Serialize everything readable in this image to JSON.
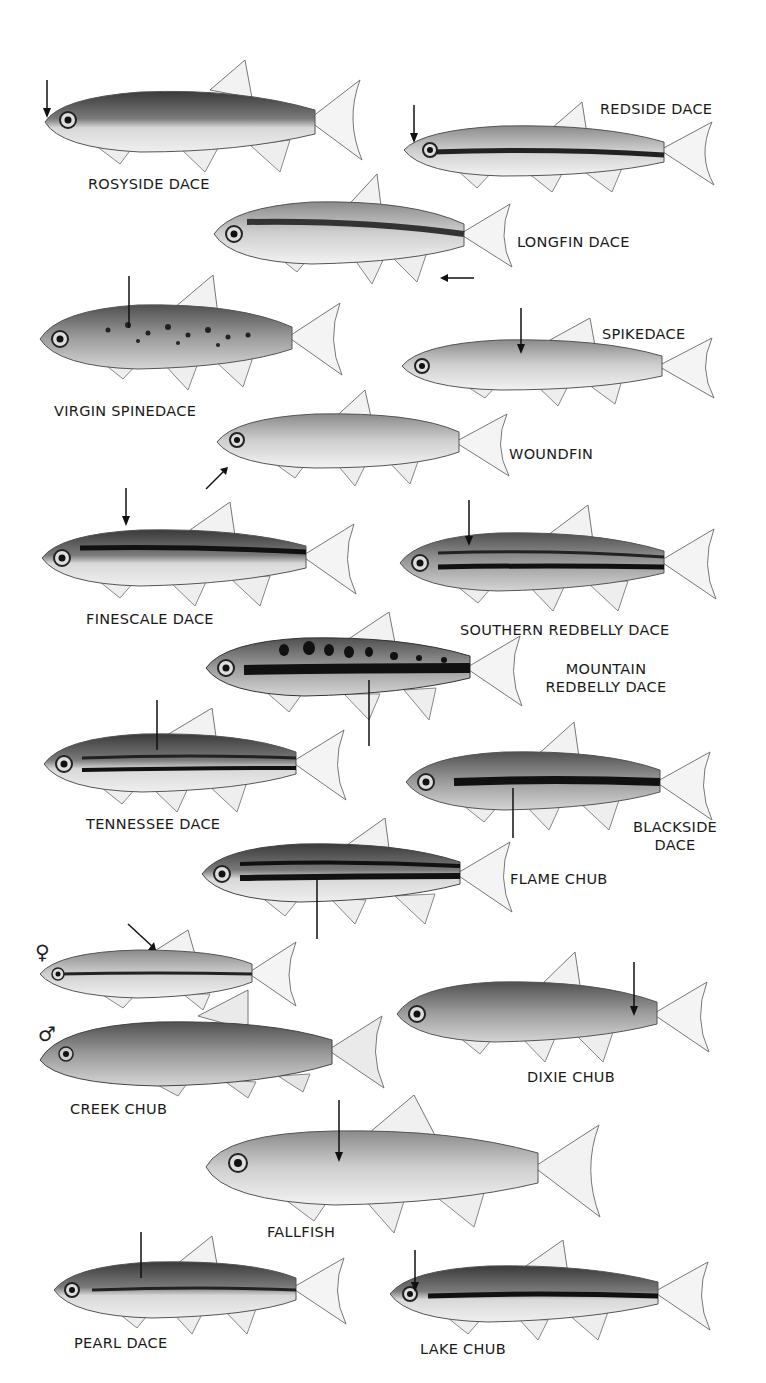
{
  "plate": {
    "species": [
      {
        "id": "rosyside",
        "label": "ROSYSIDE DACE"
      },
      {
        "id": "redside",
        "label": "REDSIDE DACE"
      },
      {
        "id": "longfin",
        "label": "LONGFIN DACE"
      },
      {
        "id": "virgin",
        "label": "VIRGIN SPINEDACE"
      },
      {
        "id": "spikedace",
        "label": "SPIKEDACE"
      },
      {
        "id": "woundfin",
        "label": "WOUNDFIN"
      },
      {
        "id": "finescale",
        "label": "FINESCALE DACE"
      },
      {
        "id": "southern",
        "label": "SOUTHERN REDBELLY DACE"
      },
      {
        "id": "mountain",
        "label_line1": "MOUNTAIN",
        "label_line2": "REDBELLY DACE"
      },
      {
        "id": "tennessee",
        "label": "TENNESSEE DACE"
      },
      {
        "id": "blackside",
        "label_line1": "BLACKSIDE",
        "label_line2": "DACE"
      },
      {
        "id": "flame",
        "label": "FLAME CHUB"
      },
      {
        "id": "creek",
        "label": "CREEK CHUB",
        "female_symbol": "♀",
        "male_symbol": "♂"
      },
      {
        "id": "dixie",
        "label": "DIXIE CHUB"
      },
      {
        "id": "fallfish",
        "label": "FALLFISH"
      },
      {
        "id": "pearl",
        "label": "PEARL DACE"
      },
      {
        "id": "lake",
        "label": "LAKE CHUB"
      }
    ]
  }
}
